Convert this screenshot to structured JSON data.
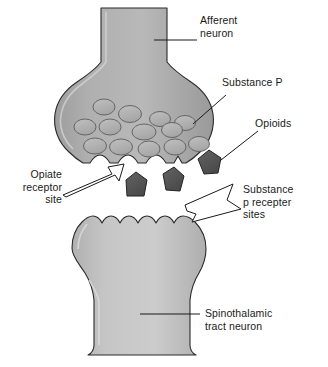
{
  "figure": {
    "type": "biological-diagram",
    "width": 328,
    "height": 367,
    "background_color": "#ffffff"
  },
  "colors": {
    "presynaptic_fill": "#a9a9a9",
    "presynaptic_fill_light": "#c2c2c2",
    "postsynaptic_fill": "#bcbcbc",
    "postsynaptic_fill_light": "#d2d2d2",
    "vesicle_fill": "#b4b4b4",
    "opioid_fill": "#575757",
    "outline": "#2b2b2b",
    "arrow_fill": "#ffffff",
    "label_color": "#1a1a1a",
    "leader_line": "#1a1a1a"
  },
  "labels": {
    "afferent_neuron": "Afferent\nneuron",
    "substance_p": "Substance P",
    "opioids": "Opioids",
    "opiate_receptor_site": "Opiate\nreceptor\nsite",
    "substance_p_receptor_sites": "Substance\np recepter\nsites",
    "spinothalamic_tract_neuron": "Spinothalamic\ntract neuron"
  },
  "structures": {
    "presynaptic_terminal": "afferent neuron axon terminal (bouton)",
    "synaptic_cleft": "synaptic cleft",
    "postsynaptic_neuron": "spinothalamic tract neuron dendrite",
    "vesicle_count": 13,
    "opioid_molecule_count": 3,
    "receptor_site_count": 5
  }
}
